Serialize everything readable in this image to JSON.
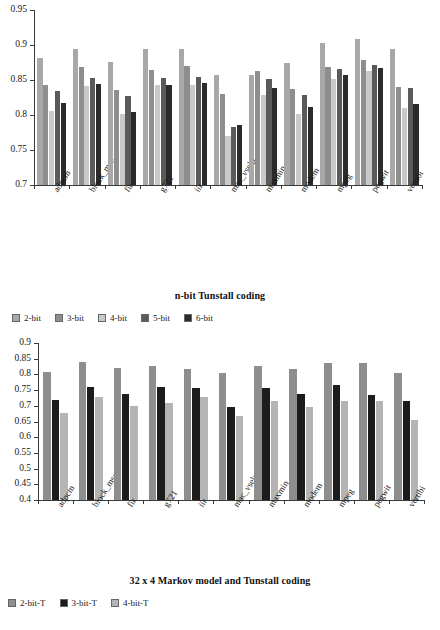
{
  "chart_data": [
    {
      "type": "bar",
      "id": "n-bit-tunstall",
      "title": "n-bit Tunstall coding",
      "xlabel": "",
      "ylabel": "",
      "ylim": [
        0.7,
        0.95
      ],
      "ytick_values": [
        0.7,
        0.75,
        0.8,
        0.85,
        0.9,
        0.95
      ],
      "ytick_labels": [
        "0.7",
        "0.75",
        "0.8",
        "0.85",
        "0.9",
        "0.95"
      ],
      "grid": false,
      "legend_position": "below",
      "categories": [
        "adpcm",
        "block_mse",
        "fir",
        "g721",
        "iir",
        "mac_vselp",
        "maxmin",
        "modem",
        "mpeg",
        "pegwit",
        "vertibi"
      ],
      "series": [
        {
          "name": "2-bit",
          "color": "#a8a8a8",
          "values": [
            0.882,
            0.894,
            0.876,
            0.894,
            0.895,
            0.857,
            0.857,
            0.875,
            0.903,
            0.908,
            0.894
          ]
        },
        {
          "name": "3-bit",
          "color": "#8e8e8e",
          "values": [
            0.843,
            0.869,
            0.836,
            0.864,
            0.87,
            0.83,
            0.863,
            0.837,
            0.869,
            0.878,
            0.84
          ]
        },
        {
          "name": "4-bit",
          "color": "#c9c9c9",
          "values": [
            0.806,
            0.842,
            0.802,
            0.843,
            0.843,
            0.77,
            0.829,
            0.802,
            0.851,
            0.863,
            0.81
          ]
        },
        {
          "name": "5-bit",
          "color": "#5a5a5a",
          "values": [
            0.834,
            0.853,
            0.827,
            0.853,
            0.855,
            0.783,
            0.852,
            0.828,
            0.866,
            0.872,
            0.839
          ]
        },
        {
          "name": "6-bit",
          "color": "#2b2b2b",
          "values": [
            0.817,
            0.844,
            0.805,
            0.843,
            0.846,
            0.786,
            0.838,
            0.811,
            0.857,
            0.867,
            0.816
          ]
        }
      ]
    },
    {
      "type": "bar",
      "id": "markov-tunstall",
      "title": "32 x 4 Markov model and Tunstall coding",
      "xlabel": "",
      "ylabel": "",
      "ylim": [
        0.4,
        0.9
      ],
      "ytick_values": [
        0.4,
        0.45,
        0.5,
        0.55,
        0.6,
        0.65,
        0.7,
        0.75,
        0.8,
        0.85,
        0.9
      ],
      "ytick_labels": [
        "0.4",
        "0.45",
        "0.5",
        "0.55",
        "0.6",
        "0.65",
        "0.7",
        "0.75",
        "0.8",
        "0.85",
        "0.9"
      ],
      "grid": false,
      "legend_position": "below",
      "categories": [
        "adpcm",
        "block_mse",
        "fir",
        "g721",
        "iir",
        "mac_vselp",
        "maxmin",
        "modem",
        "mpeg",
        "pegwit",
        "vertibi"
      ],
      "series": [
        {
          "name": "2-bit-T",
          "color": "#8e8e8e",
          "values": [
            0.809,
            0.84,
            0.819,
            0.828,
            0.818,
            0.806,
            0.827,
            0.817,
            0.836,
            0.836,
            0.806
          ]
        },
        {
          "name": "3-bit-T",
          "color": "#1c1c1c",
          "values": [
            0.719,
            0.759,
            0.739,
            0.759,
            0.758,
            0.697,
            0.758,
            0.737,
            0.767,
            0.736,
            0.716
          ]
        },
        {
          "name": "4-bit-T",
          "color": "#b4b4b4",
          "values": [
            0.678,
            0.729,
            0.698,
            0.708,
            0.728,
            0.667,
            0.716,
            0.695,
            0.716,
            0.716,
            0.655
          ]
        }
      ]
    }
  ]
}
